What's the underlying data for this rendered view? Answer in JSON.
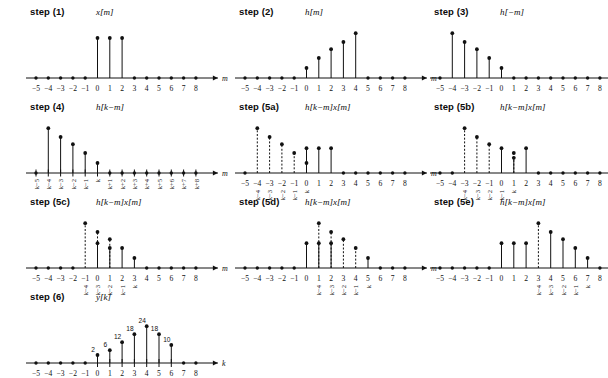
{
  "figure": {
    "kind": "discrete-convolution-steps",
    "axis_label_m": "m",
    "axis_label_k": "k",
    "tick_labels": [
      "−5",
      "−4",
      "−3",
      "−2",
      "−1",
      "0",
      "1",
      "2",
      "3",
      "4",
      "5",
      "6",
      "7",
      "8"
    ],
    "tick_values": [
      -5,
      -4,
      -3,
      -2,
      -1,
      0,
      1,
      2,
      3,
      4,
      5,
      6,
      7,
      8
    ]
  },
  "panels": [
    {
      "id": "step1",
      "title": "step (1)",
      "signal": "x[m]",
      "axis": "m",
      "stems": [
        {
          "x": 0,
          "h": 1.0,
          "dashed": false
        },
        {
          "x": 1,
          "h": 1.0,
          "dashed": false
        },
        {
          "x": 2,
          "h": 1.0,
          "dashed": false
        }
      ],
      "klabels": []
    },
    {
      "id": "step2",
      "title": "step (2)",
      "signal": "h[m]",
      "axis": "m",
      "stems": [
        {
          "x": 0,
          "h": 0.25,
          "dashed": false
        },
        {
          "x": 1,
          "h": 0.5,
          "dashed": false
        },
        {
          "x": 2,
          "h": 0.72,
          "dashed": false
        },
        {
          "x": 3,
          "h": 0.9,
          "dashed": false
        },
        {
          "x": 4,
          "h": 1.12,
          "dashed": false
        }
      ],
      "klabels": []
    },
    {
      "id": "step3",
      "title": "step (3)",
      "signal": "h[−m]",
      "axis": "m",
      "stems": [
        {
          "x": -4,
          "h": 1.12,
          "dashed": false
        },
        {
          "x": -3,
          "h": 0.9,
          "dashed": false
        },
        {
          "x": -2,
          "h": 0.72,
          "dashed": false
        },
        {
          "x": -1,
          "h": 0.5,
          "dashed": false
        },
        {
          "x": 0,
          "h": 0.25,
          "dashed": false
        }
      ],
      "klabels": []
    },
    {
      "id": "step4",
      "title": "step (4)",
      "signal": "h[k−m]",
      "axis": "m",
      "stems": [
        {
          "x": -4,
          "h": 1.12,
          "dashed": false
        },
        {
          "x": -3,
          "h": 0.9,
          "dashed": false
        },
        {
          "x": -2,
          "h": 0.72,
          "dashed": false
        },
        {
          "x": -1,
          "h": 0.5,
          "dashed": false
        },
        {
          "x": 0,
          "h": 0.25,
          "dashed": false
        }
      ],
      "klabels": [
        {
          "x": -5,
          "text": "k−5"
        },
        {
          "x": -4,
          "text": "k−4"
        },
        {
          "x": -3,
          "text": "k−3"
        },
        {
          "x": -2,
          "text": "k−2"
        },
        {
          "x": -1,
          "text": "k−1"
        },
        {
          "x": 0,
          "text": "k"
        },
        {
          "x": 1,
          "text": "k+1"
        },
        {
          "x": 2,
          "text": "k+2"
        },
        {
          "x": 3,
          "text": "k+3"
        },
        {
          "x": 4,
          "text": "k+4"
        },
        {
          "x": 5,
          "text": "k+5"
        },
        {
          "x": 6,
          "text": "k+6"
        },
        {
          "x": 7,
          "text": "k+7"
        },
        {
          "x": 8,
          "text": "k+8"
        }
      ],
      "hide_numeric_ticks": true
    },
    {
      "id": "step5a",
      "title": "step (5a)",
      "signal": "h[k−m]x[m]",
      "axis": "m",
      "stems": [
        {
          "x": -4,
          "h": 1.12,
          "dashed": true
        },
        {
          "x": -3,
          "h": 0.9,
          "dashed": true
        },
        {
          "x": -2,
          "h": 0.72,
          "dashed": true
        },
        {
          "x": -1,
          "h": 0.5,
          "dashed": true
        },
        {
          "x": 0,
          "h": 0.25,
          "dashed": true
        },
        {
          "x": 0,
          "h": 0.62,
          "dashed": false
        },
        {
          "x": 1,
          "h": 0.62,
          "dashed": false
        },
        {
          "x": 2,
          "h": 0.62,
          "dashed": false
        }
      ],
      "klabels": [
        {
          "x": -4,
          "text": "k−4"
        },
        {
          "x": -3,
          "text": "k−3"
        },
        {
          "x": -2,
          "text": "k−2"
        },
        {
          "x": -1,
          "text": "k−1"
        },
        {
          "x": 0,
          "text": "k"
        }
      ],
      "tick_start": 0
    },
    {
      "id": "step5b",
      "title": "step (5b)",
      "signal": "h[k−m]x[m]",
      "axis": "m",
      "stems": [
        {
          "x": -3,
          "h": 1.12,
          "dashed": true
        },
        {
          "x": -2,
          "h": 0.9,
          "dashed": true
        },
        {
          "x": -1,
          "h": 0.72,
          "dashed": true
        },
        {
          "x": 0,
          "h": 0.62,
          "dashed": false
        },
        {
          "x": 1,
          "h": 0.5,
          "dashed": true
        },
        {
          "x": 1,
          "h": 0.38,
          "dashed": false
        },
        {
          "x": 2,
          "h": 0.62,
          "dashed": false
        }
      ],
      "klabels": [
        {
          "x": -3,
          "text": "k−4"
        },
        {
          "x": -2,
          "text": "k−3"
        },
        {
          "x": -1,
          "text": "k−2"
        },
        {
          "x": 0,
          "text": "k−1"
        },
        {
          "x": 1,
          "text": "k"
        }
      ]
    },
    {
      "id": "step5c",
      "title": "step (5c)",
      "signal": "h[k−m]x[m]",
      "axis": "m",
      "stems": [
        {
          "x": -1,
          "h": 1.12,
          "dashed": true
        },
        {
          "x": 0,
          "h": 0.9,
          "dashed": true
        },
        {
          "x": 0,
          "h": 0.62,
          "dashed": false
        },
        {
          "x": 1,
          "h": 0.72,
          "dashed": true
        },
        {
          "x": 1,
          "h": 0.5,
          "dashed": false
        },
        {
          "x": 2,
          "h": 0.5,
          "dashed": false
        },
        {
          "x": 3,
          "h": 0.25,
          "dashed": false
        }
      ],
      "klabels": [
        {
          "x": -1,
          "text": "k−4"
        },
        {
          "x": 0,
          "text": "k−3"
        },
        {
          "x": 1,
          "text": "k−2"
        },
        {
          "x": 2,
          "text": "k−1"
        },
        {
          "x": 3,
          "text": "k"
        }
      ]
    },
    {
      "id": "step5d",
      "title": "step (5d)",
      "signal": "h[k−m]x[m]",
      "axis": "m",
      "stems": [
        {
          "x": 0,
          "h": 0.62,
          "dashed": false
        },
        {
          "x": 1,
          "h": 1.12,
          "dashed": true
        },
        {
          "x": 1,
          "h": 0.62,
          "dashed": false
        },
        {
          "x": 2,
          "h": 0.9,
          "dashed": true
        },
        {
          "x": 2,
          "h": 0.62,
          "dashed": false
        },
        {
          "x": 3,
          "h": 0.72,
          "dashed": true
        },
        {
          "x": 4,
          "h": 0.5,
          "dashed": true
        },
        {
          "x": 5,
          "h": 0.25,
          "dashed": false
        }
      ],
      "klabels": [
        {
          "x": 1,
          "text": "k−4"
        },
        {
          "x": 2,
          "text": "k−3"
        },
        {
          "x": 3,
          "text": "k−2"
        },
        {
          "x": 4,
          "text": "k−1"
        },
        {
          "x": 5,
          "text": "k"
        }
      ]
    },
    {
      "id": "step5e",
      "title": "step (5e)",
      "signal": "h[k−m]x[m]",
      "axis": "m",
      "stems": [
        {
          "x": 0,
          "h": 0.62,
          "dashed": false
        },
        {
          "x": 1,
          "h": 0.62,
          "dashed": false
        },
        {
          "x": 2,
          "h": 0.62,
          "dashed": false
        },
        {
          "x": 3,
          "h": 1.12,
          "dashed": true
        },
        {
          "x": 4,
          "h": 0.9,
          "dashed": false
        },
        {
          "x": 5,
          "h": 0.72,
          "dashed": false
        },
        {
          "x": 6,
          "h": 0.5,
          "dashed": false
        },
        {
          "x": 7,
          "h": 0.25,
          "dashed": false
        }
      ],
      "klabels": [
        {
          "x": 3,
          "text": "k−4"
        },
        {
          "x": 4,
          "text": "k−3"
        },
        {
          "x": 5,
          "text": "k−2"
        },
        {
          "x": 6,
          "text": "k−1"
        },
        {
          "x": 7,
          "text": "k"
        }
      ]
    },
    {
      "id": "step6",
      "title": "step (6)",
      "signal": "y[k]",
      "axis": "k",
      "stems": [
        {
          "x": 0,
          "h": 0.2,
          "dashed": false,
          "value": "2"
        },
        {
          "x": 1,
          "h": 0.32,
          "dashed": false,
          "value": "6"
        },
        {
          "x": 2,
          "h": 0.52,
          "dashed": false,
          "value": "12"
        },
        {
          "x": 3,
          "h": 0.72,
          "dashed": false,
          "value": "18"
        },
        {
          "x": 4,
          "h": 0.92,
          "dashed": false,
          "value": "24"
        },
        {
          "x": 5,
          "h": 0.72,
          "dashed": false,
          "value": "18"
        },
        {
          "x": 6,
          "h": 0.45,
          "dashed": false,
          "value": "10"
        }
      ],
      "klabels": []
    }
  ],
  "chart_data": {
    "type": "line",
    "xlabel": "m / k",
    "ylabel": "",
    "x": [
      -5,
      -4,
      -3,
      -2,
      -1,
      0,
      1,
      2,
      3,
      4,
      5,
      6,
      7,
      8
    ],
    "series": [
      {
        "name": "x[m] (step 1)",
        "values": [
          0,
          0,
          0,
          0,
          0,
          1,
          1,
          1,
          0,
          0,
          0,
          0,
          0,
          0
        ]
      },
      {
        "name": "h[m] (step 2)",
        "values": [
          0,
          0,
          0,
          0,
          0,
          2,
          4,
          6,
          8,
          10,
          0,
          0,
          0,
          0
        ]
      },
      {
        "name": "h[-m] (step 3)",
        "values": [
          0,
          10,
          8,
          6,
          4,
          2,
          0,
          0,
          0,
          0,
          0,
          0,
          0,
          0
        ]
      },
      {
        "name": "y[k] (step 6)",
        "values": [
          0,
          0,
          0,
          0,
          0,
          2,
          6,
          12,
          18,
          24,
          18,
          10,
          0,
          0
        ]
      }
    ],
    "annotations": [
      "2",
      "6",
      "12",
      "18",
      "24",
      "18",
      "10"
    ],
    "grid": false,
    "legend": "none"
  }
}
